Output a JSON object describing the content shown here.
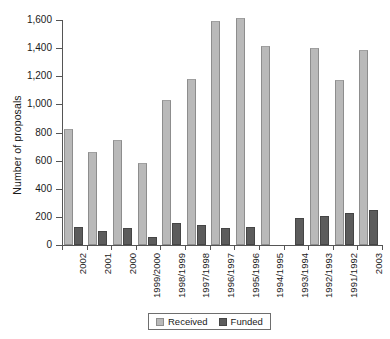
{
  "chart_data": {
    "type": "bar",
    "title": "",
    "xlabel": "",
    "ylabel": "Number of proposals",
    "ylim": [
      0,
      1600
    ],
    "ytick_step": 200,
    "ytick_labels": [
      "0",
      "200",
      "400",
      "600",
      "800",
      "1,000",
      "1,200",
      "1,400",
      "1,600"
    ],
    "ytick_values": [
      0,
      200,
      400,
      600,
      800,
      1000,
      1200,
      1400,
      1600
    ],
    "grid": false,
    "legend_position": "bottom",
    "categories": [
      "2002",
      "2001",
      "2000",
      "1999/2000",
      "1998/1999",
      "1997/1998",
      "1996/1997",
      "1995/1996",
      "1994/1995",
      "1993/1994",
      "1992/1993",
      "1991/1992",
      "2003"
    ],
    "series": [
      {
        "name": "Received",
        "color": "#b9b9b9",
        "values": [
          825,
          660,
          745,
          585,
          1030,
          1180,
          1590,
          1615,
          1415,
          null,
          1400,
          1170,
          1385
        ]
      },
      {
        "name": "Funded",
        "color": "#5c5c5c",
        "values": [
          130,
          100,
          120,
          60,
          155,
          140,
          120,
          125,
          null,
          190,
          205,
          230,
          250
        ]
      }
    ]
  },
  "legend": {
    "items": [
      {
        "label": "Received",
        "swatch": "received"
      },
      {
        "label": "Funded",
        "swatch": "funded"
      }
    ]
  }
}
